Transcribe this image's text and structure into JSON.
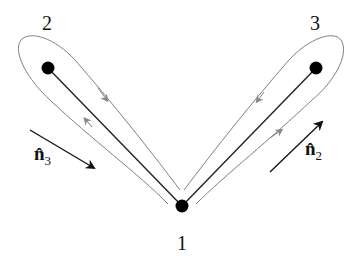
{
  "diagram": {
    "nodes": [
      {
        "id": "1",
        "label": "1",
        "x": 182,
        "y": 206
      },
      {
        "id": "2",
        "label": "2",
        "x": 48,
        "y": 68
      },
      {
        "id": "3",
        "label": "3",
        "x": 316,
        "y": 68
      }
    ],
    "edges": [
      {
        "from": "1",
        "to": "2"
      },
      {
        "from": "1",
        "to": "3"
      }
    ],
    "loops": [
      {
        "around": "2",
        "direction": "clockwise",
        "color": "#777777"
      },
      {
        "around": "3",
        "direction": "clockwise",
        "color": "#777777"
      }
    ],
    "vectors": [
      {
        "label": "n̂",
        "subscript": "3",
        "direction": "down-right"
      },
      {
        "label": "n̂",
        "subscript": "2",
        "direction": "up-right"
      }
    ],
    "colors": {
      "line": "#222222",
      "loop": "#808080",
      "node": "#000000"
    }
  }
}
